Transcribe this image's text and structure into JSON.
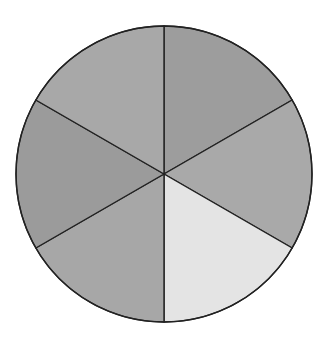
{
  "diagram": {
    "type": "circle-divided-into-equal-sectors",
    "sector_count": 6,
    "center": [
      164,
      174
    ],
    "radius": 148,
    "stroke_color": "#222222",
    "stroke_width": 1.4,
    "start_angle_deg": -90,
    "sectors": [
      {
        "name": "sector-top-right",
        "fill": "#9d9d9d",
        "shaded": false
      },
      {
        "name": "sector-right",
        "fill": "#a9a9a9",
        "shaded": false
      },
      {
        "name": "sector-bottom-right",
        "fill": "#e4e4e4",
        "shaded": true
      },
      {
        "name": "sector-bottom-left",
        "fill": "#a7a7a7",
        "shaded": false
      },
      {
        "name": "sector-left",
        "fill": "#9b9b9b",
        "shaded": false
      },
      {
        "name": "sector-top-left",
        "fill": "#a8a8a8",
        "shaded": false
      }
    ]
  }
}
